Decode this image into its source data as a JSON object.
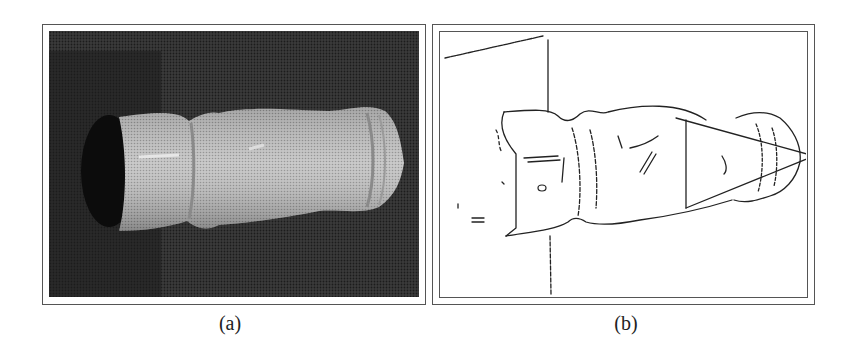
{
  "figure": {
    "panels": [
      {
        "id": "a",
        "label": "(a)",
        "description": "Grayscale halftone photograph of a turned wooden/ceramic vase-like object lying horizontally against a dark background"
      },
      {
        "id": "b",
        "label": "(b)",
        "description": "Edge-detected line drawing of the same object with a fitted cone (two converging lines to an apex at right) and a vertical cross-section line"
      }
    ]
  },
  "colors": {
    "frame": "#555555",
    "photo_background": "#2a2a2a",
    "object_fill": "#b8b8b8",
    "edge_lines": "#222222",
    "page": "#ffffff"
  }
}
